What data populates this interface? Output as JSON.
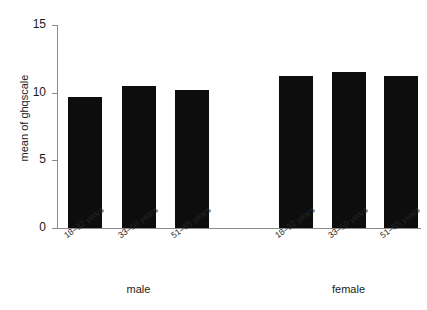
{
  "chart_data": {
    "type": "bar",
    "title": "",
    "subtitle": "",
    "xlabel": "",
    "ylabel": "mean of ghqscale",
    "ylim": [
      0,
      15
    ],
    "yticks": [
      0,
      5,
      10,
      15
    ],
    "ytick_labels": [
      "0",
      "5",
      "10",
      "15"
    ],
    "grid": false,
    "legend": "none",
    "categories": [
      "18–32 years",
      "33–50 years",
      "51–65 years"
    ],
    "groups": [
      "male",
      "female"
    ],
    "series": [
      {
        "name": "male",
        "values": [
          9.7,
          10.5,
          10.2
        ]
      },
      {
        "name": "female",
        "values": [
          11.2,
          11.5,
          11.2
        ]
      }
    ],
    "bars": [
      {
        "group": "male",
        "category": "18–32 years",
        "value": 9.7
      },
      {
        "group": "male",
        "category": "33–50 years",
        "value": 10.5
      },
      {
        "group": "male",
        "category": "51–65 years",
        "value": 10.2
      },
      {
        "group": "female",
        "category": "18–32 years",
        "value": 11.2
      },
      {
        "group": "female",
        "category": "33–50 years",
        "value": 11.5
      },
      {
        "group": "female",
        "category": "51–65 years",
        "value": 11.2
      }
    ],
    "bar_color": "#0d0d0d",
    "axis_color": "#8c8c8c",
    "background_color": "#ffffff"
  },
  "axis": {
    "y_title": "mean of ghqscale",
    "ticks": [
      "0",
      "5",
      "10",
      "15"
    ]
  },
  "categories": {
    "male": [
      "18–32 years",
      "33–50 years",
      "51–65 years"
    ],
    "female": [
      "18–32 years",
      "33–50 years",
      "51–65 years"
    ]
  },
  "groups": {
    "male_label": "male",
    "female_label": "female"
  }
}
